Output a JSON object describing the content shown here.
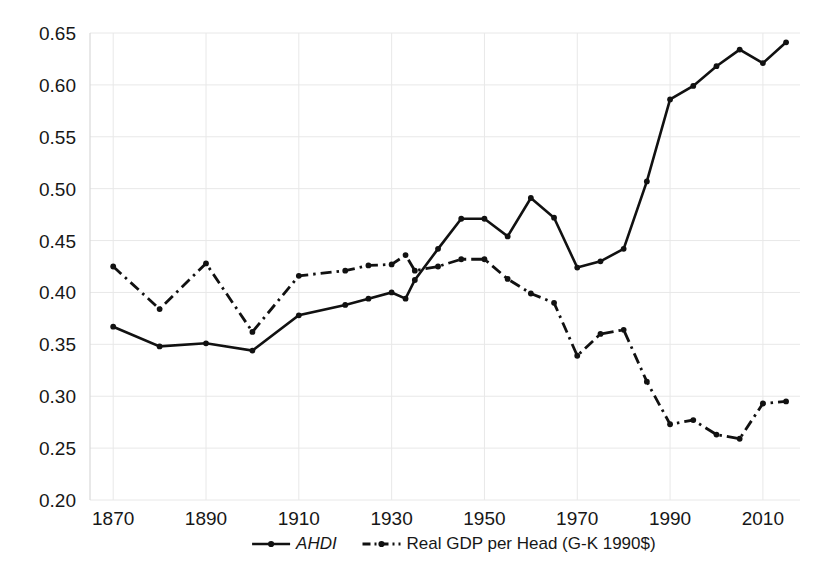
{
  "chart_data": {
    "type": "line",
    "title": "",
    "subtitle": "",
    "xlabel": "",
    "ylabel": "",
    "xlim": [
      1865,
      2018
    ],
    "ylim": [
      0.2,
      0.65
    ],
    "grid": true,
    "legend_position": "bottom",
    "y_ticks": [
      "0.20",
      "0.25",
      "0.30",
      "0.35",
      "0.40",
      "0.45",
      "0.50",
      "0.55",
      "0.60",
      "0.65"
    ],
    "y_tick_values": [
      0.2,
      0.25,
      0.3,
      0.35,
      0.4,
      0.45,
      0.5,
      0.55,
      0.6,
      0.65
    ],
    "x_ticks": [
      "1870",
      "1890",
      "1910",
      "1930",
      "1950",
      "1970",
      "1990",
      "2010"
    ],
    "x_tick_values": [
      1870,
      1890,
      1910,
      1930,
      1950,
      1970,
      1990,
      2010
    ],
    "x": [
      1870,
      1880,
      1890,
      1900,
      1910,
      1920,
      1925,
      1930,
      1933,
      1935,
      1940,
      1945,
      1950,
      1955,
      1960,
      1965,
      1970,
      1975,
      1980,
      1985,
      1990,
      1995,
      2000,
      2005,
      2010,
      2015
    ],
    "series": [
      {
        "name": "AHDI",
        "style": "solid",
        "marker": "dot",
        "color": "#111111",
        "values": [
          0.367,
          0.348,
          0.351,
          0.344,
          0.378,
          0.388,
          0.394,
          0.4,
          0.394,
          0.412,
          0.442,
          0.471,
          0.471,
          0.454,
          0.491,
          0.472,
          0.424,
          0.43,
          0.442,
          0.507,
          0.586,
          0.599,
          0.618,
          0.634,
          0.621,
          0.641
        ]
      },
      {
        "name": "Real GDP per Head (G-K 1990$)",
        "style": "dash-dot",
        "marker": "dot",
        "color": "#111111",
        "values": [
          0.425,
          0.384,
          0.428,
          0.362,
          0.416,
          0.421,
          0.426,
          0.427,
          0.436,
          0.421,
          0.425,
          0.432,
          0.432,
          0.413,
          0.399,
          0.39,
          0.339,
          0.36,
          0.364,
          0.314,
          0.273,
          0.277,
          0.263,
          0.259,
          0.293,
          0.295
        ]
      }
    ],
    "legend": [
      {
        "label": "AHDI",
        "style": "solid",
        "italic": true
      },
      {
        "label": "Real GDP per Head (G-K 1990$)",
        "style": "dash-dot",
        "italic": false
      }
    ],
    "colors": {
      "line": "#111111",
      "grid": "#e8e8e8",
      "background": "#ffffff",
      "text": "#171717"
    }
  }
}
